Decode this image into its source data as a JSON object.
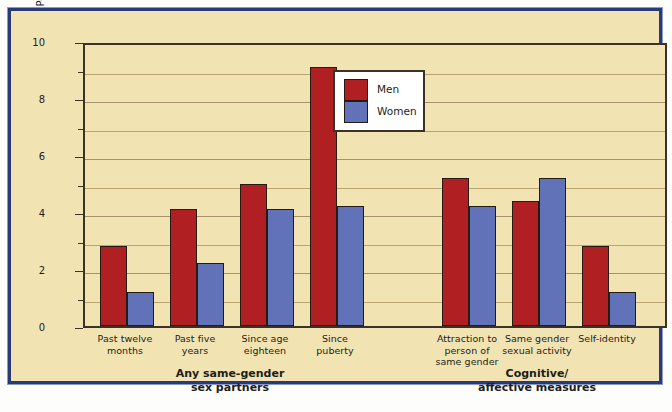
{
  "figure": {
    "background_color": "#f2e3b3",
    "frame_color": "#2a3a78"
  },
  "legend": {
    "position": "inside-top-center",
    "entries": [
      {
        "label": "Men",
        "color": "#b01f22"
      },
      {
        "label": "Women",
        "color": "#6272b8"
      }
    ]
  },
  "groups": [
    {
      "caption_line1": "Any same-gender",
      "caption_line2": "sex partners"
    },
    {
      "caption_line1": "Cognitive/",
      "caption_line2": "affective measures"
    }
  ],
  "chart_data": {
    "type": "bar",
    "title": "",
    "xlabel": "",
    "ylabel": "Percent of Total NHSLS Sample",
    "ylim": [
      0,
      10
    ],
    "yticks": [
      0,
      2,
      4,
      6,
      8,
      10
    ],
    "ytick_labels": [
      "0",
      "2",
      "4",
      "6",
      "8",
      "10"
    ],
    "minor_yticks": [
      1,
      3,
      5,
      7,
      9
    ],
    "grid": true,
    "grid_axis": "y",
    "grid_step": 1,
    "legend_position": "upper center",
    "categories": [
      "Past twelve months",
      "Past five years",
      "Since age eighteen",
      "Since puberty",
      "Attraction to person of same gender",
      "Same gender sexual activity",
      "Self-identity"
    ],
    "category_lines": [
      [
        "Past twelve",
        "months"
      ],
      [
        "Past five",
        "years"
      ],
      [
        "Since age",
        "eighteen"
      ],
      [
        "Since",
        "puberty"
      ],
      [
        "Attraction to",
        "person of",
        "same gender"
      ],
      [
        "Same gender",
        "sexual activity"
      ],
      [
        "Self-identity"
      ]
    ],
    "series": [
      {
        "name": "Men",
        "color": "#b01f22",
        "values": [
          2.8,
          4.1,
          5.0,
          9.1,
          5.2,
          4.4,
          2.8
        ]
      },
      {
        "name": "Women",
        "color": "#6272b8",
        "values": [
          1.2,
          2.2,
          4.1,
          4.2,
          4.2,
          5.2,
          1.2
        ]
      }
    ]
  }
}
